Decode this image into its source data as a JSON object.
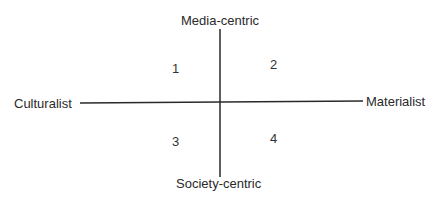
{
  "diagram": {
    "axes": {
      "top": "Media-centric",
      "bottom": "Society-centric",
      "left": "Culturalist",
      "right": "Materialist"
    },
    "quadrants": [
      {
        "id": "top-left",
        "label": "1"
      },
      {
        "id": "top-right",
        "label": "2"
      },
      {
        "id": "bottom-left",
        "label": "3"
      },
      {
        "id": "bottom-right",
        "label": "4"
      }
    ],
    "line_color": "#2a2a2a"
  }
}
